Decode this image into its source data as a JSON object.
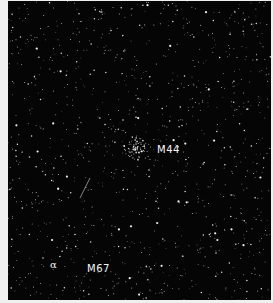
{
  "image": {
    "description": "Black-and-white astronomical photograph of a star field",
    "background_color": "#050505",
    "border_color": "#f0f0f0",
    "star_color": "#ffffff"
  },
  "annotations": {
    "m44": "M44",
    "m67": "M67",
    "alpha": "α"
  },
  "features": {
    "cluster_m44": "open star cluster M44",
    "streak": "faint diagonal streak (satellite/meteor trail)"
  }
}
